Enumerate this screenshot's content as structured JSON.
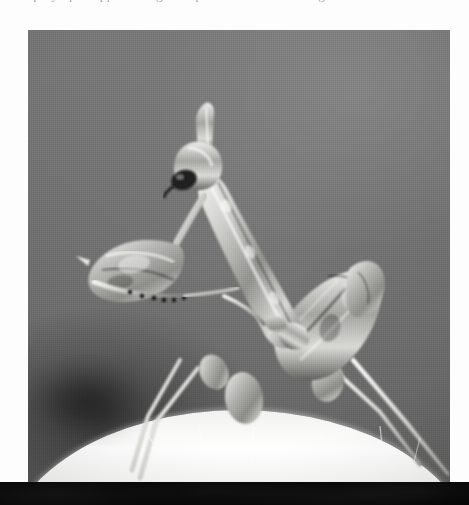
{
  "page": {
    "background_color": "#fdfdfd",
    "width": 469,
    "height": 505,
    "top_text_line": "of prey upon approaching the tips of the raised forelegs",
    "scan_band_color": "#060606"
  },
  "photograph": {
    "caption": "",
    "alt_text": "Black-and-white photograph of a flower mantis standing on a pale curved surface, thorax raised, raptorial foreleg extended to the left",
    "subject": "mantis",
    "subject_common_name": "flower mantis",
    "medium": "black-and-white photograph",
    "background_color": "#6f6f6f",
    "highlight_color": "#f2f2f0",
    "shadow_color": "#3a3a3a",
    "frame": {
      "x": 28,
      "y": 30,
      "width": 422,
      "height": 452
    },
    "parts": [
      {
        "name": "head",
        "label": "head with pointed frontal crest"
      },
      {
        "name": "eye",
        "label": "compound eye"
      },
      {
        "name": "prothorax",
        "label": "elongated prothorax"
      },
      {
        "name": "raptorial-foreleg",
        "label": "raised raptorial foreleg"
      },
      {
        "name": "abdomen",
        "label": "textured abdomen and wing buds"
      },
      {
        "name": "midleg",
        "label": "middle leg with lobed femur"
      },
      {
        "name": "hindleg",
        "label": "hind leg with lobed femur"
      },
      {
        "name": "substrate",
        "label": "pale curved substrate with fine hairs"
      },
      {
        "name": "shadow",
        "label": "soft dark shadow at lower left"
      }
    ]
  }
}
